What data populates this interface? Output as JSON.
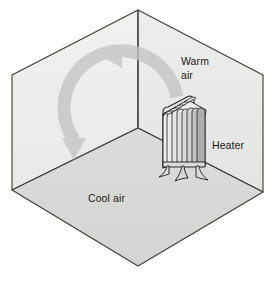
{
  "diagram": {
    "type": "isometric-room-cutaway",
    "background_color": "#ffffff",
    "labels": {
      "warm_air_line1": "Warm",
      "warm_air_line2": "air",
      "heater": "Heater",
      "cool_air": "Cool air"
    },
    "surfaces": {
      "left_wall_label": "left-wall",
      "left_wall_color": "#eeeeec",
      "right_wall_label": "right-wall",
      "right_wall_color": "#e8e8e6",
      "floor_label": "floor",
      "floor_color": "#d9d9d7",
      "outline_color": "#3a3a3a"
    },
    "airflow": {
      "name": "convection-current",
      "direction": "counterclockwise",
      "arrow_color": "#c9c9c7",
      "arrowheads": 2,
      "top_arrow_direction": "left",
      "bottom_arrow_direction": "down"
    },
    "heater": {
      "name": "radiator",
      "fin_count": 8,
      "body_color": "#e6e6e4",
      "fin_shadow_color": "#8e8e8c",
      "outline_color": "#2a2a2a",
      "legs": 2
    }
  }
}
